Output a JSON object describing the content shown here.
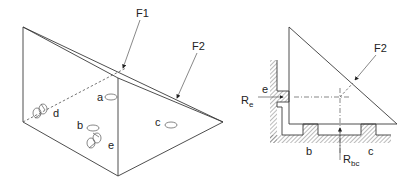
{
  "figure": {
    "left_view": {
      "description": "Isometric view of triangular prism workpiece with locating points",
      "labels": {
        "f1": "F1",
        "f2": "F2",
        "a": "a",
        "b": "b",
        "c": "c",
        "d": "d",
        "e": "e"
      }
    },
    "right_view": {
      "description": "Side section view of prism in fixture with reaction forces",
      "labels": {
        "f2": "F2",
        "e": "e",
        "re_main": "R",
        "re_sub": "e",
        "b": "b",
        "c": "c",
        "rbc_main": "R",
        "rbc_sub": "bc"
      }
    },
    "colors": {
      "line": "#3a3a3a",
      "background": "#ffffff"
    }
  }
}
